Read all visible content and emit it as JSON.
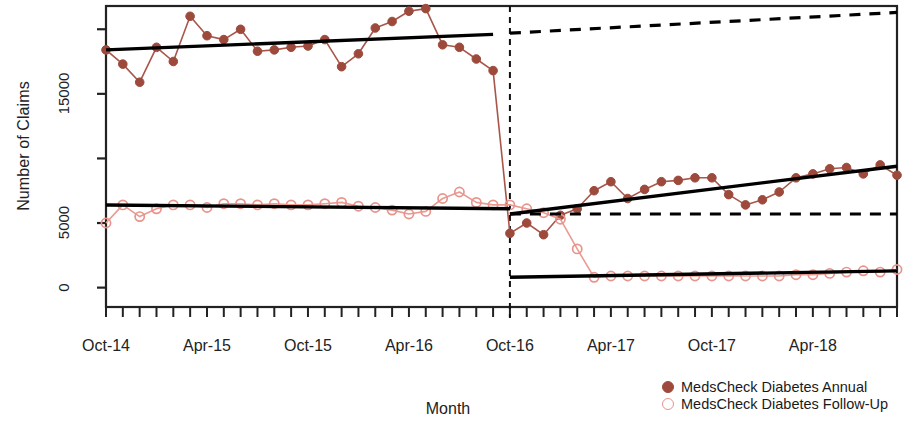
{
  "chart_data": {
    "type": "line",
    "title": "",
    "xlabel": "Month",
    "ylabel": "Number of Claims",
    "grid": false,
    "legend_position": "bottom-right",
    "xlim": [
      0,
      47
    ],
    "ylim": [
      -1500,
      21800
    ],
    "y_ticks": [
      0,
      5000,
      10000,
      15000,
      20000
    ],
    "y_tick_labels": [
      "0",
      "5000",
      "",
      "15000",
      ""
    ],
    "x_tick_labels": [
      "Oct-14",
      "Apr-15",
      "Oct-15",
      "Apr-16",
      "Oct-16",
      "Apr-17",
      "Oct-17",
      "Apr-18"
    ],
    "x_tick_label_indices": [
      0,
      6,
      12,
      18,
      24,
      30,
      36,
      42
    ],
    "x_minor_tick_count": 47,
    "intervention": {
      "label": "Oct-16",
      "index": 24,
      "style": "dashed-vertical"
    },
    "colors": {
      "annual_marker": "#9d4a3c",
      "annual_line": "#a8564a",
      "followup_marker": "#e8948c",
      "followup_line": "#ea9a92",
      "fit_line": "#000000",
      "counterfactual": "#000000",
      "axis": "#222222"
    },
    "series": [
      {
        "name": "MedsCheck Diabetes Annual",
        "marker": "filled-circle",
        "values": [
          18400,
          17300,
          15900,
          18600,
          17500,
          21000,
          19500,
          19200,
          20000,
          18300,
          18400,
          18600,
          18700,
          19200,
          17100,
          18100,
          20100,
          20600,
          21400,
          21600,
          18800,
          18600,
          17700,
          16800,
          4200,
          5000,
          4100,
          5600,
          6100,
          7500,
          8200,
          6900,
          7600,
          8200,
          8300,
          8500,
          8500,
          7200,
          6400,
          6800,
          7400,
          8500,
          8800,
          9200,
          9300,
          8800,
          9500,
          8700
        ]
      },
      {
        "name": "MedsCheck Diabetes Follow-Up",
        "marker": "open-circle",
        "values": [
          5000,
          6400,
          5500,
          6100,
          6400,
          6400,
          6200,
          6500,
          6500,
          6400,
          6500,
          6400,
          6400,
          6500,
          6600,
          6300,
          6200,
          6000,
          5700,
          5900,
          6900,
          7400,
          6600,
          6400,
          6400,
          6100,
          5800,
          5300,
          3000,
          800,
          900,
          900,
          900,
          900,
          900,
          900,
          900,
          900,
          900,
          900,
          900,
          1000,
          1000,
          1100,
          1200,
          1300,
          1200,
          1400
        ]
      }
    ],
    "fit_segments": [
      {
        "name": "annual-pre-fit",
        "x0": 0,
        "y0": 18400,
        "x1": 23,
        "y1": 19600
      },
      {
        "name": "annual-post-fit",
        "x0": 24,
        "y0": 5700,
        "x1": 47,
        "y1": 9400
      },
      {
        "name": "annual-counterfactual",
        "x0": 24,
        "y0": 19700,
        "x1": 47,
        "y1": 21300,
        "dashed": true
      },
      {
        "name": "followup-pre-fit",
        "x0": 0,
        "y0": 6400,
        "x1": 24,
        "y1": 6100
      },
      {
        "name": "followup-post-fit",
        "x0": 24,
        "y0": 800,
        "x1": 47,
        "y1": 1300
      },
      {
        "name": "followup-counterfactual",
        "x0": 24,
        "y0": 5700,
        "x1": 47,
        "y1": 5700,
        "dashed": true
      }
    ]
  },
  "legend": {
    "items": [
      {
        "label": "MedsCheck Diabetes Annual",
        "marker": "filled-circle",
        "color": "#9d4a3c"
      },
      {
        "label": "MedsCheck Diabetes Follow-Up",
        "marker": "open-circle",
        "color": "#e8948c"
      }
    ]
  }
}
